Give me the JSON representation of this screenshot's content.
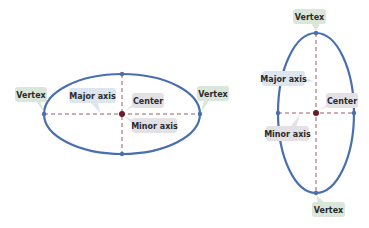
{
  "colors": {
    "ellipse": "#4a6fb0",
    "axis_dash": "#a05a64",
    "center_dot": "#6a1a28",
    "vertex_dot": "#4a6fb0",
    "label_green": "#d9e6d9",
    "label_blue": "#dde6ee",
    "label_gray": "#e4e1e6"
  },
  "horizontal_ellipse": {
    "labels": {
      "vertex_left": "Vertex",
      "vertex_right": "Vertex",
      "major_axis": "Major axis",
      "center": "Center",
      "minor_axis": "Minor axis"
    }
  },
  "vertical_ellipse": {
    "labels": {
      "vertex_top": "Vertex",
      "vertex_bottom": "Vertex",
      "major_axis": "Major axis",
      "center": "Center",
      "minor_axis": "Minor axis"
    }
  }
}
